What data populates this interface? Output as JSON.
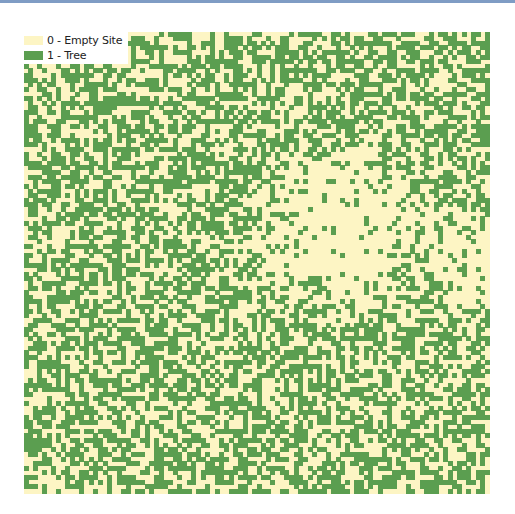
{
  "chart_data": {
    "type": "heatmap",
    "title": "",
    "grid_size": [
      100,
      100
    ],
    "categories": [
      {
        "value": 0,
        "label": "0 - Empty Site",
        "color": "#fdf5c4"
      },
      {
        "value": 1,
        "label": "1 - Tree",
        "color": "#5b9e50"
      }
    ],
    "approx_tree_fraction": 0.5,
    "notable_regions": [
      {
        "name": "large empty cluster",
        "approx_cells": {
          "x": [
            45,
            90
          ],
          "y": [
            20,
            70
          ]
        }
      }
    ],
    "legend_position": "top-left",
    "grid": false,
    "xlabel": "",
    "ylabel": ""
  },
  "legend": {
    "items": [
      {
        "label": "0 - Empty Site",
        "color": "#fdf5c4"
      },
      {
        "label": "1 - Tree",
        "color": "#5b9e50"
      }
    ]
  }
}
